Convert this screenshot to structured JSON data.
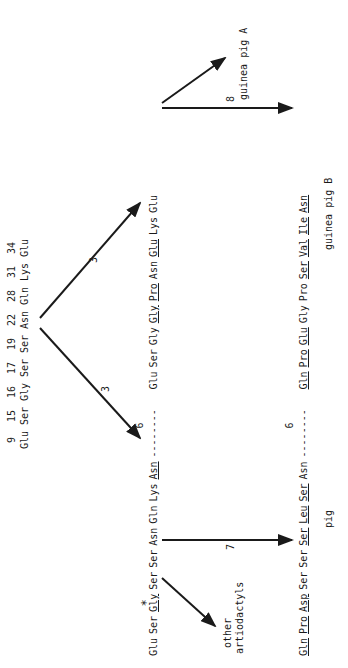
{
  "ancestor": {
    "positions": [
      "9",
      "15",
      "16",
      "17",
      "19",
      "22",
      "28",
      "31",
      "34"
    ],
    "residues": [
      "Glu",
      "Ser",
      "Gly",
      "Ser",
      "Ser",
      "Asn",
      "Gln",
      "Lys",
      "Glu"
    ]
  },
  "branches_top": {
    "left_label": "3",
    "right_label": "3"
  },
  "middle_row": {
    "left": [
      {
        "r": "Glu",
        "u": false
      },
      {
        "r": "Ser",
        "u": false
      },
      {
        "r": "Gly",
        "u": true,
        "star": "*"
      },
      {
        "r": "Ser",
        "u": false
      },
      {
        "r": "Ser",
        "u": false
      },
      {
        "r": "Asn",
        "u": false
      },
      {
        "r": "Gln",
        "u": false
      },
      {
        "r": "Lys",
        "u": false
      },
      {
        "r": "Asn",
        "u": true
      }
    ],
    "gap_label": "6",
    "gap_dashes": "--------",
    "right": [
      {
        "r": "Glu",
        "u": false
      },
      {
        "r": "Ser",
        "u": false
      },
      {
        "r": "Gly",
        "u": false
      },
      {
        "r": "Gly",
        "u": true
      },
      {
        "r": "Pro",
        "u": true
      },
      {
        "r": "Asn",
        "u": false
      },
      {
        "r": "Glu",
        "u": true
      },
      {
        "r": "Lys",
        "u": false
      },
      {
        "r": "Glu",
        "u": false
      }
    ]
  },
  "bottom_row": {
    "left": [
      {
        "r": "Gln",
        "u": true
      },
      {
        "r": "Pro",
        "u": true
      },
      {
        "r": "Asp",
        "u": true
      },
      {
        "r": "Ser",
        "u": false
      },
      {
        "r": "Ser",
        "u": false
      },
      {
        "r": "Ser",
        "u": true
      },
      {
        "r": "Leu",
        "u": true
      },
      {
        "r": "Ser",
        "u": true
      },
      {
        "r": "Asn",
        "u": false
      }
    ],
    "gap_label": "6",
    "gap_dashes": "--------",
    "right": [
      {
        "r": "Gln",
        "u": true
      },
      {
        "r": "Pro",
        "u": true
      },
      {
        "r": "Glu",
        "u": true
      },
      {
        "r": "Gly",
        "u": false
      },
      {
        "r": "Pro",
        "u": false
      },
      {
        "r": "Ser",
        "u": true
      },
      {
        "r": "Val",
        "u": true
      },
      {
        "r": "Ile",
        "u": true
      },
      {
        "r": "Asn",
        "u": true
      }
    ]
  },
  "edges": {
    "pig_label": "7",
    "guinea_pig_b_label": "8"
  },
  "taxa": {
    "other_artiodactyls_line1": "other",
    "other_artiodactyls_line2": "artiodactyls",
    "pig": "pig",
    "guinea_pig_a": "guinea pig A",
    "guinea_pig_b": "guinea pig B"
  },
  "colors": {
    "ink": "#1a1a1a",
    "background": "#ffffff"
  }
}
